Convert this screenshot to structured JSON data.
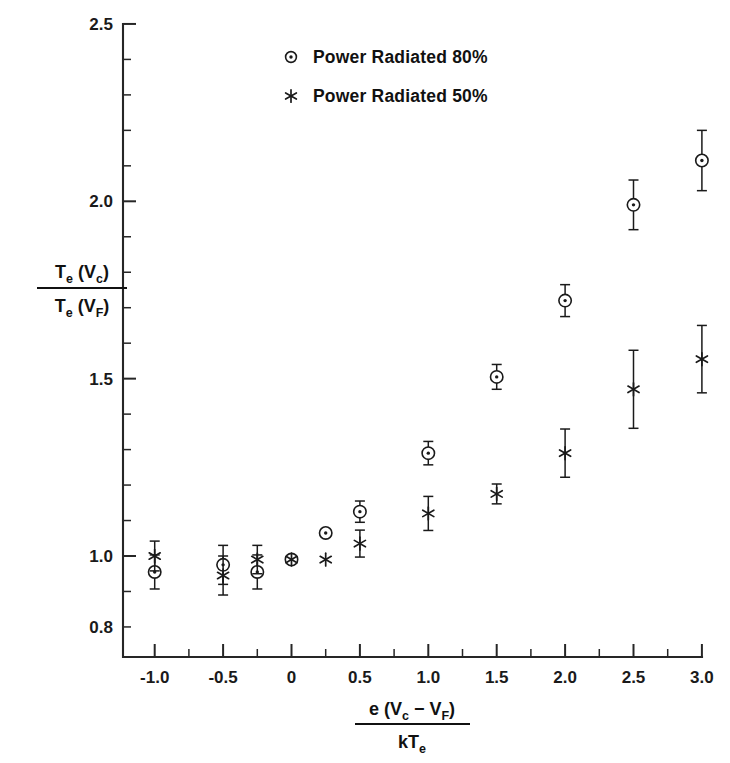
{
  "chart_data": {
    "type": "scatter",
    "title": "",
    "subtitle": "",
    "xlabel": "e (V_c - V_F) / kT_e",
    "ylabel": "T_e (V_c) / T_e (V_F)",
    "xlim": [
      -1.25,
      3.15
    ],
    "ylim": [
      0.8,
      2.5
    ],
    "grid": false,
    "legend_position": "top-center",
    "x_ticks": [
      -1.0,
      -0.5,
      0,
      0.5,
      1.0,
      1.5,
      2.0,
      2.5,
      3.0
    ],
    "x_tick_labels": [
      "-1.0",
      "-0.5",
      "0",
      "0.5",
      "1.0",
      "1.5",
      "2.0",
      "2.5",
      "3.0"
    ],
    "x_minor_per_major": 2,
    "y_ticks": [
      0.8,
      1.0,
      1.5,
      2.0,
      2.5
    ],
    "y_tick_labels": [
      "0.8",
      "1.0",
      "1.5",
      "2.0",
      "2.5"
    ],
    "y_major_labeled": [
      1.0,
      1.5,
      2.0,
      2.5
    ],
    "y_minor_step": 0.1,
    "series": [
      {
        "name": "Power Radiated 80%",
        "marker": "circle-dot",
        "points": [
          {
            "x": -1.0,
            "y": 0.955,
            "yerr": 0.048
          },
          {
            "x": -0.5,
            "y": 0.975,
            "yerr": 0.055
          },
          {
            "x": -0.25,
            "y": 0.955,
            "yerr": 0.048
          },
          {
            "x": 0.0,
            "y": 0.99,
            "yerr": 0.0
          },
          {
            "x": 0.25,
            "y": 1.065,
            "yerr": 0.0
          },
          {
            "x": 0.5,
            "y": 1.125,
            "yerr": 0.03
          },
          {
            "x": 1.0,
            "y": 1.29,
            "yerr": 0.033
          },
          {
            "x": 1.5,
            "y": 1.505,
            "yerr": 0.035
          },
          {
            "x": 2.0,
            "y": 1.72,
            "yerr": 0.045
          },
          {
            "x": 2.5,
            "y": 1.99,
            "yerr": 0.07
          },
          {
            "x": 3.0,
            "y": 2.115,
            "yerr": 0.085
          }
        ]
      },
      {
        "name": "Power Radiated 50%",
        "marker": "asterisk",
        "points": [
          {
            "x": -1.0,
            "y": 1.0,
            "yerr": 0.042
          },
          {
            "x": -0.5,
            "y": 0.945,
            "yerr": 0.055
          },
          {
            "x": -0.25,
            "y": 0.99,
            "yerr": 0.04
          },
          {
            "x": 0.0,
            "y": 0.99,
            "yerr": 0.0
          },
          {
            "x": 0.25,
            "y": 0.99,
            "yerr": 0.0
          },
          {
            "x": 0.5,
            "y": 1.035,
            "yerr": 0.038
          },
          {
            "x": 1.0,
            "y": 1.12,
            "yerr": 0.048
          },
          {
            "x": 1.5,
            "y": 1.175,
            "yerr": 0.028
          },
          {
            "x": 2.0,
            "y": 1.29,
            "yerr": 0.068
          },
          {
            "x": 2.5,
            "y": 1.47,
            "yerr": 0.11
          },
          {
            "x": 3.0,
            "y": 1.555,
            "yerr": 0.095
          }
        ]
      }
    ]
  },
  "legend": {
    "entries": [
      {
        "marker": "circle-dot",
        "label": "Power Radiated 80%"
      },
      {
        "marker": "asterisk",
        "label": "Power Radiated 50%"
      }
    ]
  },
  "y_axis_title": {
    "numerator_main": "T",
    "numerator_sub": "e",
    "numerator_rest": " (V",
    "numerator_rest_sub": "c",
    "numerator_close": ")",
    "denominator_main": "T",
    "denominator_sub": "e",
    "denominator_rest": " (V",
    "denominator_rest_sub": "F",
    "denominator_close": ")"
  },
  "x_axis_title": {
    "numerator_lead": "e (V",
    "numerator_sub1": "c",
    "numerator_mid": " − V",
    "numerator_sub2": "F",
    "numerator_close": ")",
    "denominator_lead": "kT",
    "denominator_sub": "e"
  },
  "colors": {
    "ink": "#1a1a1a",
    "background": "#ffffff",
    "axis": "#262626"
  }
}
